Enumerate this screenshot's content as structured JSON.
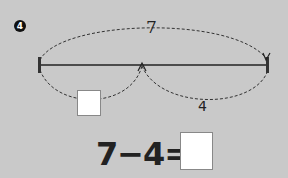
{
  "problem": {
    "number": "4",
    "total_label": "7",
    "known_part_label": "4",
    "unknown_part_value": "",
    "equation": {
      "left": "7",
      "operator": "−",
      "right": "4",
      "equals": "=",
      "answer_value": ""
    }
  }
}
